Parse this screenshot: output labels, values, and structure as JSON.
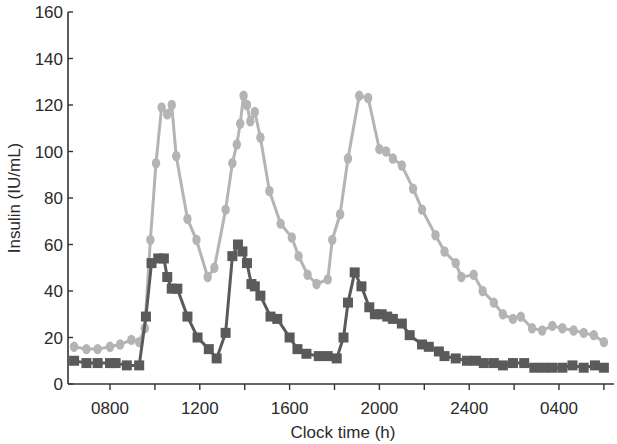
{
  "chart_data": {
    "type": "line",
    "title": "",
    "xlabel": "Clock time (h)",
    "ylabel": "Insulin (IU/mL)",
    "ylim": [
      0,
      160
    ],
    "xlim_hours_elapsed": [
      -1.85,
      22.2
    ],
    "x_tick_labels": [
      "0800",
      "1200",
      "1600",
      "2000",
      "2400",
      "0400"
    ],
    "x_tick_positions_hours_elapsed": [
      0,
      2,
      4,
      6,
      8,
      10,
      12,
      14,
      16,
      18,
      20,
      22
    ],
    "x_labeled_tick_hours_elapsed": [
      0,
      4,
      8,
      12,
      16,
      20
    ],
    "y_ticks": [
      0,
      20,
      40,
      60,
      80,
      100,
      120,
      140,
      160
    ],
    "y_tick_labels": [
      "0",
      "20",
      "40",
      "60",
      "80",
      "100",
      "120",
      "140",
      "160"
    ],
    "grid": false,
    "legend": "none",
    "x_unit_note": "x values are hours elapsed since 0800 clock time",
    "series": [
      {
        "name": "Upper series (light gray circles)",
        "marker": "circle",
        "color": "#b4b4b4",
        "x": [
          -1.6,
          -1.05,
          -0.55,
          0.0,
          0.45,
          0.95,
          1.3,
          1.55,
          1.8,
          2.05,
          2.3,
          2.55,
          2.75,
          2.95,
          3.45,
          3.85,
          4.35,
          4.65,
          5.15,
          5.45,
          5.65,
          5.8,
          5.95,
          6.1,
          6.25,
          6.45,
          6.7,
          7.1,
          7.6,
          8.1,
          8.4,
          8.8,
          9.2,
          9.7,
          9.9,
          10.25,
          10.6,
          11.1,
          11.5,
          12.0,
          12.3,
          12.6,
          13.0,
          13.5,
          13.9,
          14.5,
          14.9,
          15.4,
          15.65,
          16.2,
          16.6,
          17.1,
          17.5,
          17.95,
          18.3,
          18.8,
          19.25,
          19.7,
          20.15,
          20.65,
          21.1,
          21.55,
          22.0
        ],
        "values": [
          16,
          15,
          15,
          16,
          17,
          19,
          18,
          24,
          62,
          95,
          119,
          116,
          120,
          98,
          71,
          62,
          46,
          50,
          75,
          95,
          103,
          112,
          124,
          120,
          113,
          117,
          106,
          83,
          69,
          63,
          55,
          47,
          43,
          45,
          62,
          73,
          97,
          124,
          123,
          101,
          100,
          97,
          94,
          84,
          75,
          64,
          57,
          52,
          46,
          47,
          40,
          35,
          30,
          28,
          29,
          24,
          23,
          25,
          24,
          23,
          22,
          21,
          18
        ],
        "note": "Values read from pixel positions; approximate"
      },
      {
        "name": "Lower series (dark gray squares)",
        "marker": "square",
        "color": "#5a5a5a",
        "x": [
          -1.6,
          -1.05,
          -0.55,
          0.0,
          0.25,
          0.75,
          1.3,
          1.6,
          1.85,
          2.15,
          2.4,
          2.55,
          2.75,
          3.0,
          3.45,
          3.9,
          4.4,
          4.75,
          5.15,
          5.45,
          5.7,
          5.9,
          6.1,
          6.3,
          6.45,
          6.7,
          7.15,
          7.45,
          8.0,
          8.35,
          8.75,
          9.3,
          9.7,
          10.1,
          10.4,
          10.6,
          10.9,
          11.2,
          11.55,
          11.8,
          12.1,
          12.35,
          12.6,
          13.0,
          13.35,
          13.9,
          14.2,
          14.65,
          14.9,
          15.4,
          15.9,
          16.3,
          16.65,
          17.1,
          17.5,
          17.95,
          18.45,
          18.9,
          19.3,
          19.7,
          20.15,
          20.6,
          21.1,
          21.6,
          22.0
        ],
        "values": [
          10,
          9,
          9,
          9,
          9,
          8,
          8,
          29,
          52,
          54,
          54,
          46,
          41,
          41,
          29,
          20,
          15,
          11,
          22,
          55,
          60,
          57,
          52,
          43,
          42,
          38,
          29,
          28,
          20,
          15,
          13,
          12,
          12,
          11,
          20,
          35,
          48,
          42,
          33,
          30,
          30,
          29,
          28,
          26,
          21,
          17,
          16,
          14,
          12,
          11,
          10,
          10,
          9,
          9,
          8,
          9,
          9,
          7,
          7,
          7,
          7,
          8,
          7,
          8,
          7
        ],
        "note": "Values read from pixel positions; approximate"
      }
    ]
  }
}
